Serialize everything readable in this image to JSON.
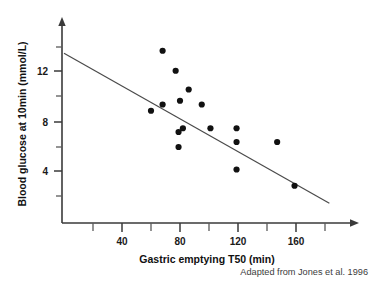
{
  "chart_data": {
    "type": "scatter",
    "title": "",
    "xlabel": "Gastric emptying T50 (min)",
    "ylabel": "Blood glucose at 10min (mmol/L)",
    "xlim": [
      0,
      204
    ],
    "ylim": [
      0,
      14.8
    ],
    "xticks": [
      40,
      80,
      120,
      160
    ],
    "xtick_labels": [
      "40",
      "80",
      "120",
      "160"
    ],
    "xminor_ticks": [
      20,
      60,
      100,
      140,
      180
    ],
    "yticks": [
      4,
      8,
      12
    ],
    "ytick_labels": [
      "4",
      "8",
      "12"
    ],
    "yminor_ticks": [
      2,
      6,
      10,
      14
    ],
    "grid": false,
    "legend": "none",
    "points": [
      {
        "x": 68,
        "y": 13.7
      },
      {
        "x": 77,
        "y": 12.1
      },
      {
        "x": 86,
        "y": 10.6
      },
      {
        "x": 95,
        "y": 9.4
      },
      {
        "x": 80,
        "y": 9.7
      },
      {
        "x": 68,
        "y": 9.4
      },
      {
        "x": 60,
        "y": 8.9
      },
      {
        "x": 82,
        "y": 7.5
      },
      {
        "x": 79,
        "y": 7.2
      },
      {
        "x": 79,
        "y": 6.0
      },
      {
        "x": 101,
        "y": 7.5
      },
      {
        "x": 119,
        "y": 7.5
      },
      {
        "x": 119,
        "y": 6.4
      },
      {
        "x": 147,
        "y": 6.4
      },
      {
        "x": 119,
        "y": 4.2
      },
      {
        "x": 159,
        "y": 2.9
      }
    ],
    "trendline": {
      "x_start": 0,
      "y_start": 13.5,
      "x_end": 183,
      "y_end": 1.5,
      "style": "solid"
    },
    "caption": "Adapted from Jones et al. 1996"
  },
  "colors": {
    "point": "#111111",
    "axis": "#3a3a3a",
    "trendline": "#4a4a4a",
    "text": "#1a1a1a",
    "caption": "#3c3c3c",
    "background": "#ffffff"
  }
}
